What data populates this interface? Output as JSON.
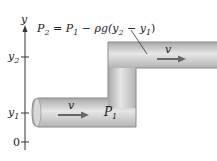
{
  "diagram": {
    "axis": {
      "label": "y",
      "ticks": [
        {
          "main": "y",
          "sub": "2"
        },
        {
          "main": "y",
          "sub": "1"
        },
        {
          "main": "0",
          "sub": ""
        }
      ]
    },
    "equation": {
      "p2": "P",
      "p2_sub": "2",
      "eq": " = ",
      "p1": "P",
      "p1_sub": "1",
      "rest": " − ρg(",
      "y2": "y",
      "y2_sub": "2",
      "minus": " − ",
      "y1": "y",
      "y1_sub": "1",
      "close": ")"
    },
    "upper_flow": {
      "label": "v"
    },
    "lower_flow": {
      "label": "v"
    },
    "point_label": {
      "main": "P",
      "sub": "1"
    },
    "colors": {
      "pipe_fill": "#c9c9c9",
      "pipe_edge": "#8a8a8a",
      "arrow": "#6a6a6a",
      "axis": "#333333"
    }
  }
}
